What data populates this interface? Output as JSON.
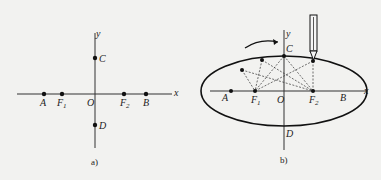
{
  "figure_a": {
    "caption": "a)",
    "axes": {
      "x": "x",
      "y": "y"
    },
    "origin_label": "O",
    "points": [
      {
        "label": "A",
        "sub": ""
      },
      {
        "label": "F",
        "sub": "1"
      },
      {
        "label": "F",
        "sub": "2"
      },
      {
        "label": "B",
        "sub": ""
      },
      {
        "label": "C",
        "sub": ""
      },
      {
        "label": "D",
        "sub": ""
      }
    ]
  },
  "figure_b": {
    "caption": "b)",
    "axes": {
      "x": "x",
      "y": "y"
    },
    "origin_label": "O",
    "points": [
      {
        "label": "A",
        "sub": ""
      },
      {
        "label": "F",
        "sub": "1"
      },
      {
        "label": "F",
        "sub": "2"
      },
      {
        "label": "B",
        "sub": ""
      },
      {
        "label": "C",
        "sub": ""
      },
      {
        "label": "D",
        "sub": ""
      }
    ],
    "annotations": [
      "pencil-tracing-ellipse",
      "curved-arrow-direction"
    ]
  },
  "colors": {
    "ink": "#222222",
    "background": "#f2f2f0"
  }
}
